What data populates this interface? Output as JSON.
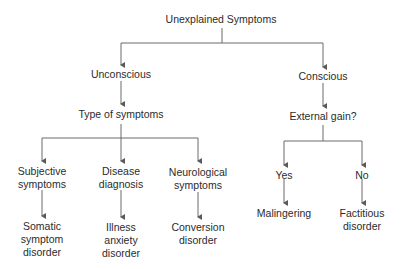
{
  "diagram": {
    "root": "Unexplained Symptoms",
    "unconscious": {
      "label": "Unconscious",
      "question": "Type of symptoms",
      "branches": [
        {
          "label": "Subjective\nsymptoms",
          "outcome": "Somatic\nsymptom\ndisorder"
        },
        {
          "label": "Disease\ndiagnosis",
          "outcome": "Illness\nanxiety\ndisorder"
        },
        {
          "label": "Neurological\nsymptoms",
          "outcome": "Conversion\ndisorder"
        }
      ]
    },
    "conscious": {
      "label": "Conscious",
      "question": "External gain?",
      "branches": [
        {
          "label": "Yes",
          "outcome": "Malingering"
        },
        {
          "label": "No",
          "outcome": "Factitious\ndisorder"
        }
      ]
    }
  },
  "colors": {
    "line": "#5a5a5a",
    "text": "#2b2b2b",
    "background": "#ffffff"
  }
}
